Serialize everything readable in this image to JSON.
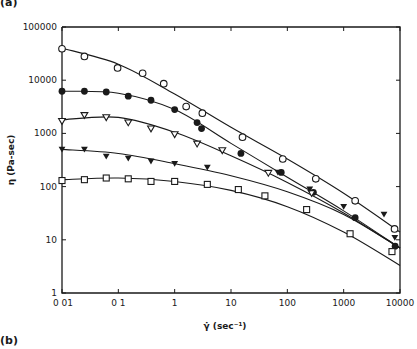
{
  "panel_labels": {
    "top": "(a)",
    "bottom": "(b)"
  },
  "chart_data": {
    "type": "scatter",
    "title": "",
    "xlabel": "γ̇  (sec⁻¹)",
    "ylabel": "η  (Pa-sec)",
    "xscale": "log",
    "yscale": "log",
    "xlim": [
      0.01,
      10000
    ],
    "ylim": [
      1,
      100000
    ],
    "x_ticks": [
      0.01,
      0.1,
      1,
      10,
      100,
      1000,
      10000
    ],
    "x_tick_labels": [
      "0 01",
      "0 1",
      "1",
      "10",
      "100",
      "1000",
      "10000"
    ],
    "y_ticks": [
      1,
      10,
      100,
      1000,
      10000,
      100000
    ],
    "y_tick_labels": [
      "1",
      "10",
      "100",
      "1000",
      "10000",
      "100000"
    ],
    "grid": false,
    "legend": null,
    "series": [
      {
        "name": "open circles",
        "marker": "circle-open",
        "x": [
          0.01,
          0.025,
          0.097,
          0.27,
          0.64,
          1.6,
          3.1,
          16,
          83,
          320,
          1600,
          8000
        ],
        "y": [
          39000,
          28000,
          17000,
          13500,
          8600,
          3200,
          2400,
          850,
          330,
          140,
          54,
          16
        ],
        "fit": {
          "x": [
            0.01,
            0.1,
            1,
            10,
            100,
            1000,
            10000
          ],
          "y": [
            40000,
            20000,
            5500,
            1300,
            330,
            75,
            14
          ]
        }
      },
      {
        "name": "filled circles",
        "marker": "circle-filled",
        "x": [
          0.01,
          0.025,
          0.061,
          0.15,
          0.38,
          1.0,
          2.5,
          3.0,
          15,
          78,
          290,
          1600,
          8200
        ],
        "y": [
          6200,
          6200,
          6000,
          5000,
          4200,
          2800,
          1600,
          1230,
          420,
          185,
          78,
          26,
          7.6
        ],
        "fit": {
          "x": [
            0.01,
            0.1,
            1,
            10,
            100,
            1000,
            10000
          ],
          "y": [
            6200,
            5700,
            2800,
            650,
            150,
            35,
            7
          ]
        }
      },
      {
        "name": "open triangles",
        "marker": "triangle-down-open",
        "x": [
          0.01,
          0.025,
          0.061,
          0.15,
          0.38,
          1.0,
          2.5,
          7.0,
          46,
          270
        ],
        "y": [
          1700,
          2200,
          2000,
          1600,
          1230,
          960,
          640,
          480,
          180,
          75
        ],
        "fit": {
          "x": [
            0.01,
            0.1,
            1,
            10,
            100,
            1000,
            10000
          ],
          "y": [
            1800,
            2000,
            1050,
            380,
            120,
            32,
            7
          ]
        }
      },
      {
        "name": "filled triangles",
        "marker": "triangle-down-filled",
        "x": [
          0.01,
          0.025,
          0.061,
          0.15,
          0.38,
          1.0,
          3.8,
          68,
          250,
          1000,
          5200,
          8100
        ],
        "y": [
          500,
          500,
          370,
          340,
          300,
          270,
          230,
          185,
          90,
          42,
          30,
          11
        ],
        "fit": {
          "x": [
            0.01,
            0.1,
            1,
            10,
            100,
            1000,
            10000
          ],
          "y": [
            500,
            420,
            270,
            160,
            80,
            30,
            7
          ]
        }
      },
      {
        "name": "squares",
        "marker": "square-open",
        "x": [
          0.01,
          0.025,
          0.061,
          0.15,
          0.38,
          1.0,
          3.8,
          13.5,
          40,
          220,
          1300,
          7200
        ],
        "y": [
          130,
          135,
          145,
          140,
          125,
          125,
          110,
          88,
          67,
          37,
          13,
          6
        ],
        "fit": {
          "x": [
            0.01,
            0.1,
            1,
            10,
            100,
            1000,
            10000
          ],
          "y": [
            135,
            145,
            125,
            85,
            42,
            14,
            3.3
          ]
        }
      }
    ]
  }
}
